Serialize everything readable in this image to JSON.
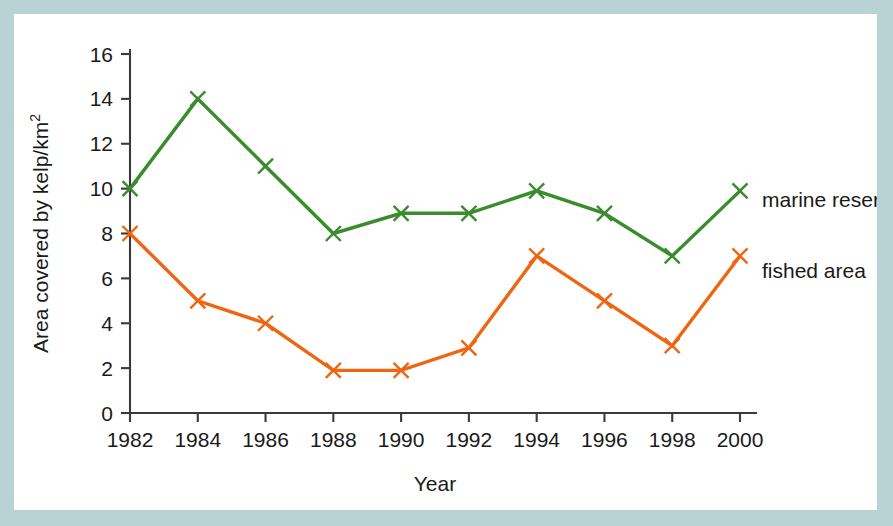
{
  "figure": {
    "border_color": "#b9d2d4",
    "plate_color": "#ffffff",
    "axis_color": "#3a3a3a"
  },
  "chart_data": {
    "type": "line",
    "title": "",
    "xlabel": "Year",
    "ylabel": "Area covered by kelp/km",
    "ylabel_superscript": "2",
    "categories": [
      1982,
      1984,
      1986,
      1988,
      1990,
      1992,
      1994,
      1996,
      1998,
      2000
    ],
    "x": [
      1982,
      1984,
      1986,
      1988,
      1990,
      1992,
      1994,
      1996,
      1998,
      2000
    ],
    "xtick_labels": [
      "1982",
      "1984",
      "1986",
      "1988",
      "1990",
      "1992",
      "1994",
      "1996",
      "1998",
      "2000"
    ],
    "ytick_labels": [
      "0",
      "2",
      "4",
      "6",
      "8",
      "10",
      "12",
      "14",
      "16"
    ],
    "yticks": [
      0,
      2,
      4,
      6,
      8,
      10,
      12,
      14,
      16
    ],
    "xlim": [
      1981,
      2001
    ],
    "ylim": [
      0,
      16
    ],
    "grid": false,
    "legend_position": "inline-right",
    "marker": "x",
    "series": [
      {
        "name": "marine reserve",
        "color": "#3a8c2e",
        "label": "marine reserve",
        "values": [
          10,
          14,
          11,
          8,
          8.9,
          8.9,
          9.9,
          8.9,
          7,
          9.9
        ]
      },
      {
        "name": "fished area",
        "color": "#ee6611",
        "label": "fished area",
        "values": [
          8,
          5,
          4,
          1.9,
          1.9,
          2.9,
          7,
          5,
          3,
          7
        ]
      }
    ]
  }
}
